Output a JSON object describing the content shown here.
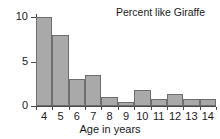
{
  "chart_data": {
    "type": "bar",
    "title": "Percent like Giraffe",
    "xlabel": "Age in years",
    "ylabel": "",
    "categories": [
      "4",
      "5",
      "6",
      "7",
      "8",
      "9",
      "10",
      "11",
      "12",
      "13",
      "14"
    ],
    "values": [
      10.0,
      8.0,
      3.0,
      3.5,
      1.0,
      0.5,
      1.8,
      0.8,
      1.3,
      0.8,
      0.8
    ],
    "xlim": [
      3.5,
      14.5
    ],
    "ylim": [
      0,
      10
    ],
    "yticks": [
      0,
      5,
      10
    ],
    "ytick_labels": [
      "0",
      "5",
      "10"
    ],
    "xtick_labels": [
      "4",
      "5",
      "6",
      "7",
      "8",
      "9",
      "10",
      "11",
      "12",
      "13",
      "14"
    ],
    "grid": false,
    "legend": false,
    "bar_color": "#a9a9a9",
    "bar_edge_color": "#6e6e6e",
    "axis_color": "#4a4a4a",
    "text_color": "#1a1a1a",
    "background": "#ffffff"
  }
}
